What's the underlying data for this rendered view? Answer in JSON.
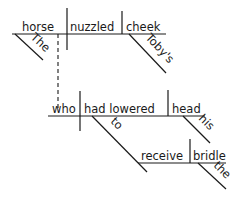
{
  "diagram": {
    "type": "sentence-diagram",
    "sentence": "The horse nuzzled Toby's cheek, who had lowered his head to receive the bridle.",
    "main_clause": {
      "subject": "horse",
      "verb": "nuzzled",
      "object": "cheek",
      "subject_modifier": "The",
      "object_modifier": "Toby's"
    },
    "relative_clause": {
      "subject": "who",
      "verb": "had lowered",
      "object": "head",
      "object_modifier": "his",
      "infinitive_connector": "to",
      "infinitive": {
        "verb": "receive",
        "object": "bridle",
        "object_modifier": "the"
      }
    }
  }
}
